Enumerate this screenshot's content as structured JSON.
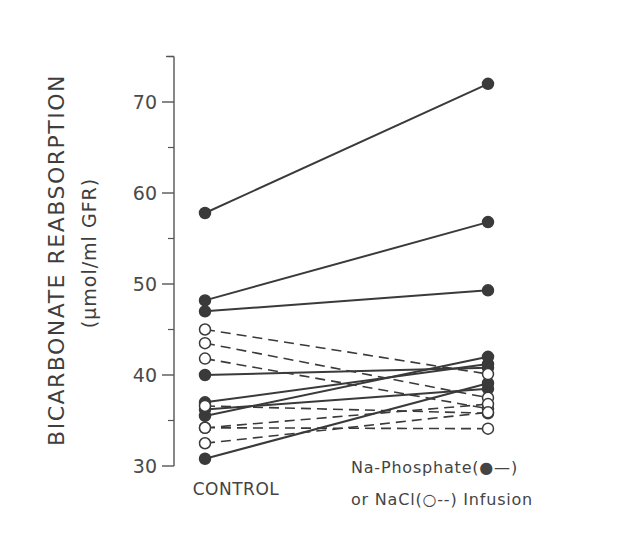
{
  "chart_data": {
    "type": "line",
    "title": "",
    "xlabel": "",
    "ylabel": "BICARBONATE REABSORPTION",
    "ylabel_units": "(µmol/ml GFR)",
    "categories": [
      "CONTROL",
      "Na-Phosphate or NaCl Infusion"
    ],
    "x_tick_labels": [
      "CONTROL"
    ],
    "legend": {
      "line1": "Na-Phosphate(●—)",
      "line2": "or  NaCl(○--) Infusion",
      "entries": [
        {
          "name": "Na-Phosphate",
          "marker": "filled-circle",
          "line": "solid"
        },
        {
          "name": "NaCl",
          "marker": "open-circle",
          "line": "dashed"
        }
      ]
    },
    "ylim": [
      30,
      75
    ],
    "yticks": [
      30,
      40,
      50,
      60,
      70
    ],
    "yticks_minor": [
      35,
      45,
      55,
      65,
      75
    ],
    "grid": false,
    "color": "#3a3a3a",
    "series": [
      {
        "name": "Na-Phosphate 1",
        "group": "Na-Phosphate",
        "values": [
          57.8,
          72.0
        ]
      },
      {
        "name": "Na-Phosphate 2",
        "group": "Na-Phosphate",
        "values": [
          48.2,
          56.8
        ]
      },
      {
        "name": "Na-Phosphate 3",
        "group": "Na-Phosphate",
        "values": [
          47.0,
          49.3
        ]
      },
      {
        "name": "Na-Phosphate 4",
        "group": "Na-Phosphate",
        "values": [
          40.0,
          40.8
        ]
      },
      {
        "name": "Na-Phosphate 5",
        "group": "Na-Phosphate",
        "values": [
          37.0,
          41.2
        ]
      },
      {
        "name": "Na-Phosphate 6",
        "group": "Na-Phosphate",
        "values": [
          35.5,
          42.0
        ]
      },
      {
        "name": "Na-Phosphate 7",
        "group": "Na-Phosphate",
        "values": [
          36.2,
          38.5
        ]
      },
      {
        "name": "Na-Phosphate 8",
        "group": "Na-Phosphate",
        "values": [
          30.8,
          39.1
        ]
      },
      {
        "name": "NaCl 1",
        "group": "NaCl",
        "values": [
          45.0,
          40.1
        ]
      },
      {
        "name": "NaCl 2",
        "group": "NaCl",
        "values": [
          43.5,
          37.5
        ]
      },
      {
        "name": "NaCl 3",
        "group": "NaCl",
        "values": [
          41.8,
          36.3
        ]
      },
      {
        "name": "NaCl 4",
        "group": "NaCl",
        "values": [
          36.6,
          35.8
        ]
      },
      {
        "name": "NaCl 5",
        "group": "NaCl",
        "values": [
          34.2,
          36.8
        ]
      },
      {
        "name": "NaCl 6",
        "group": "NaCl",
        "values": [
          32.5,
          35.9
        ]
      },
      {
        "name": "NaCl 7",
        "group": "NaCl",
        "values": [
          34.2,
          34.1
        ]
      }
    ]
  }
}
